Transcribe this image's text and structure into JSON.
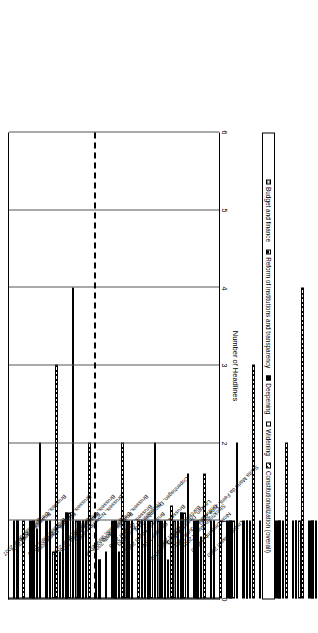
{
  "chart_data": {
    "type": "bar",
    "orientation": "vertical-rotated-90",
    "title": "",
    "xlabel": "",
    "ylabel": "Number of Headlines",
    "ylim": [
      0,
      6
    ],
    "yticks": [
      "0",
      "1",
      "2",
      "3",
      "4",
      "5",
      "6"
    ],
    "grid": true,
    "legend_position": "bottom",
    "annotations": [
      {
        "name": "dashed-separator",
        "after_category": "Brussels, June 2004"
      }
    ],
    "categories": [
      "Lisbon, March 2000",
      "Santa Maria da Feira, June 2000",
      "Nice, December 2000",
      "Stockholm, March 2001",
      "Gothenburg, June 2001",
      "Laeken, December 2001",
      "Barcelona, March 2002",
      "Seville, June 2002",
      "Brussels, October 2002",
      "Copenhagen, December 2002",
      "Brussels, March 2003",
      "Thessaloniki, June 2003",
      "Brussels, October 2003",
      "Brussels, December 2003",
      "Brussels, March 2004",
      "Brussels, June 2004",
      "Brussels, November 2004",
      "Brussels, December 2004",
      "Brussels, March 2005",
      "Brussels, June 2005",
      "Brussels, December 2005",
      "Brussels, March 2006",
      "Brussels, June 2006",
      "Brussels, December 2006",
      "Brussels, March 2007",
      "Brussels, June 2007"
    ],
    "series": [
      {
        "name": "Constitutionalization (overall)",
        "pattern": "diagonal-hatch",
        "values": [
          1,
          2,
          3,
          0,
          2,
          0.6,
          3,
          2,
          4,
          2,
          5,
          3,
          2,
          1,
          1.6,
          1.6,
          1.2,
          2,
          1,
          2,
          0.6,
          2,
          4,
          3,
          2,
          1
        ]
      },
      {
        "name": "Widening",
        "pattern": "solid-white",
        "values": [
          0,
          1.3,
          2,
          0,
          1,
          0.3,
          1,
          1,
          1,
          1,
          1,
          1,
          1,
          0,
          0.8,
          1.1,
          0.5,
          1,
          0,
          0.6,
          0,
          1,
          1.1,
          0.6,
          0.9,
          0
        ]
      },
      {
        "name": "Deepening",
        "pattern": "solid-black",
        "values": [
          1,
          0.6,
          1,
          0,
          1,
          0.4,
          1.4,
          1,
          1,
          1,
          1,
          1,
          1,
          1,
          1,
          1.1,
          1,
          1,
          1,
          1,
          0.5,
          1,
          1.1,
          1,
          1,
          1
        ]
      },
      {
        "name": "Reform of institutions and transparency",
        "pattern": "horizontal-hatch",
        "values": [
          1,
          0.6,
          1,
          0,
          0.6,
          0.3,
          1,
          1,
          1,
          1,
          1,
          1,
          1,
          1,
          1,
          1,
          1,
          1,
          1,
          1,
          1,
          1,
          1,
          1,
          1,
          1
        ]
      },
      {
        "name": "Budget and finance",
        "pattern": "grey-horizontal-hatch",
        "values": [
          0,
          0,
          0,
          0,
          0,
          0,
          0.8,
          0,
          0,
          0,
          0,
          0,
          0,
          0,
          0,
          1,
          1,
          1,
          1,
          0,
          0,
          1,
          0.6,
          0,
          0,
          0
        ]
      }
    ]
  },
  "axis": {
    "y_title": "Number of Headlines"
  },
  "legend": {
    "items": [
      {
        "label": "Constitutionalization (overall)",
        "swatch": "diagonal-hatch"
      },
      {
        "label": "Widening",
        "swatch": "solid-white"
      },
      {
        "label": "Deepening",
        "swatch": "solid-black"
      },
      {
        "label": "Reform of institutions and transparency",
        "swatch": "horizontal-hatch"
      },
      {
        "label": "Budget and finance",
        "swatch": "grey-horizontal-hatch"
      }
    ]
  }
}
